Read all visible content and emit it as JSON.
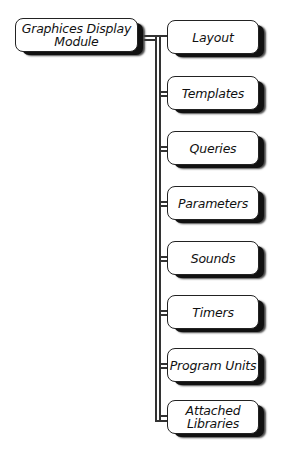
{
  "diagram": {
    "root": {
      "label_line1": "Graphices Display",
      "label_line2": "Module"
    },
    "children": [
      {
        "label_line1": "Layout",
        "label_line2": ""
      },
      {
        "label_line1": "Templates",
        "label_line2": ""
      },
      {
        "label_line1": "Queries",
        "label_line2": ""
      },
      {
        "label_line1": "Parameters",
        "label_line2": ""
      },
      {
        "label_line1": "Sounds",
        "label_line2": ""
      },
      {
        "label_line1": "Timers",
        "label_line2": ""
      },
      {
        "label_line1": "Program Units",
        "label_line2": ""
      },
      {
        "label_line1": "Attached",
        "label_line2": "Libraries"
      }
    ]
  }
}
